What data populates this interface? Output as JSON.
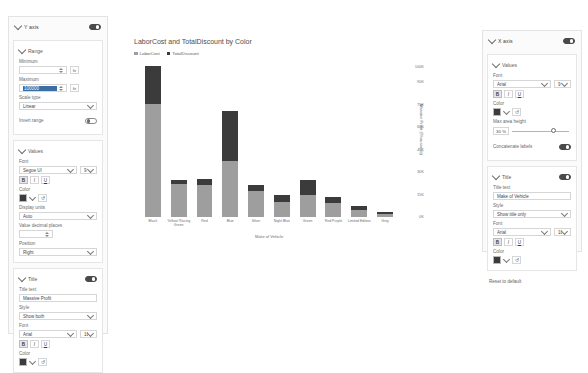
{
  "left_pane": {
    "header": {
      "title": "Y axis",
      "toggle_on": true
    },
    "range": {
      "title": "Range",
      "minimum_label": "Minimum",
      "minimum_value": "",
      "maximum_label": "Maximum",
      "maximum_value": "100000",
      "scale_type_label": "Scale type",
      "scale_type_value": "Linear",
      "invert_range_label": "Invert range",
      "invert_range_on": false
    },
    "values": {
      "title": "Values",
      "font_label": "Font",
      "font_family": "Segoe UI",
      "font_size": "9",
      "bold": "B",
      "italic": "I",
      "underline": "U",
      "color_label": "Color",
      "color_hex": "#3b3b3b",
      "display_units_label": "Display units",
      "display_units_value": "Auto",
      "decimal_places_label": "Value decimal places",
      "decimal_places_value": "",
      "position_label": "Position",
      "position_value": "Right"
    },
    "title": {
      "title": "Title",
      "toggle_on": true,
      "title_text_label": "Title text",
      "title_text_value": "Massive Profit",
      "style_label": "Style",
      "style_value": "Show both",
      "font_label": "Font",
      "font_family": "Arial",
      "font_size": "10",
      "bold": "B",
      "italic": "I",
      "underline": "U",
      "color_label": "Color",
      "color_hex": "#3b3b3b"
    }
  },
  "right_pane": {
    "header": {
      "title": "X axis",
      "toggle_on": true
    },
    "values": {
      "title": "Values",
      "font_label": "Font",
      "font_family": "Arial",
      "font_size": "9",
      "bold": "B",
      "italic": "I",
      "underline": "U",
      "color_label": "Color",
      "color_hex": "#3b3b3b",
      "max_area_label": "Max area height",
      "max_area_value": "30",
      "max_area_unit": "%",
      "concatenate_label": "Concatenate labels",
      "concatenate_on": true
    },
    "title": {
      "title": "Title",
      "toggle_on": true,
      "title_text_label": "Title text",
      "title_text_value": "Make of Vehicle",
      "style_label": "Style",
      "style_value": "Show title only",
      "font_label": "Font",
      "font_family": "Arial",
      "font_size": "10",
      "bold": "B",
      "italic": "I",
      "underline": "U",
      "color_label": "Color",
      "color_hex": "#3b3b3b"
    },
    "reset_label": "Reset to default"
  },
  "chart_data": {
    "type": "bar",
    "stacked": true,
    "title": "LaborCost and TotalDiscount by Color",
    "xlabel": "Make of Vehicle",
    "ylabel": "Massive Profit (Thousands)",
    "categories": [
      "Black",
      "Yellow/ Racing Green",
      "Red",
      "Blue",
      "Silver",
      "Night Blue",
      "Green",
      "Red Purple",
      "Limited Edition",
      "Grey"
    ],
    "series": [
      {
        "name": "LaborCost",
        "color": "#9e9e9e",
        "values": [
          75000,
          22000,
          21000,
          37000,
          17500,
          10000,
          14500,
          9500,
          4500,
          2200
        ]
      },
      {
        "name": "TotalDiscount",
        "color": "#3b3b3b",
        "values": [
          25000,
          2500,
          4000,
          33000,
          3500,
          4500,
          10000,
          4000,
          3000,
          1200
        ]
      }
    ],
    "ylim": [
      0,
      100000
    ],
    "ytick_labels": [
      "0K",
      "15K",
      "30K",
      "45K",
      "60K",
      "75K",
      "90K",
      "100K"
    ],
    "ytick_values": [
      0,
      15000,
      30000,
      45000,
      60000,
      75000,
      90000,
      100000
    ],
    "legend_position": "top-left",
    "grid": false
  }
}
